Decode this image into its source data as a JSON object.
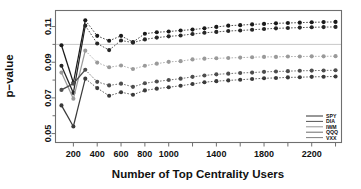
{
  "chart_data": {
    "type": "line",
    "title": "",
    "xlabel": "Number of Top Centrality Users",
    "ylabel": "p−value",
    "xlim": [
      50,
      2450
    ],
    "ylim": [
      0.045,
      0.119
    ],
    "xticks": [
      200,
      400,
      600,
      800,
      1000,
      1400,
      1800,
      2200
    ],
    "xtick_labels": [
      "200",
      "400",
      "600",
      "800",
      "1000",
      "1400",
      "1800",
      "2200"
    ],
    "yticks": [
      0.05,
      0.07,
      0.09,
      0.11
    ],
    "ytick_labels": [
      "0.05",
      "0.07",
      "0.09",
      "0.11"
    ],
    "grid": false,
    "legend_position": "bottom-right",
    "reference_line": {
      "orientation": "horizontal",
      "value": 0.1,
      "color": "#c9c9c9"
    },
    "x": [
      100,
      200,
      300,
      400,
      500,
      600,
      700,
      800,
      900,
      1000,
      1100,
      1200,
      1300,
      1400,
      1500,
      1600,
      1700,
      1800,
      1900,
      2000,
      2100,
      2200,
      2300,
      2400
    ],
    "series": [
      {
        "name": "SPY",
        "color": "#1a1a1a",
        "values": [
          0.0995,
          0.0785,
          0.1135,
          0.1048,
          0.102,
          0.1048,
          0.1013,
          0.106,
          0.1068,
          0.1072,
          0.1078,
          0.1083,
          0.109,
          0.1098,
          0.1105,
          0.1108,
          0.1112,
          0.1115,
          0.1118,
          0.112,
          0.1122,
          0.1124,
          0.1125,
          0.1126
        ]
      },
      {
        "name": "DIA",
        "color": "#262626",
        "values": [
          0.088,
          0.0728,
          0.1105,
          0.1005,
          0.0968,
          0.1022,
          0.101,
          0.1028,
          0.1038,
          0.1045,
          0.105,
          0.1058,
          0.1065,
          0.107,
          0.1075,
          0.1078,
          0.1082,
          0.1086,
          0.109,
          0.1092,
          0.1094,
          0.1096,
          0.1097,
          0.1098
        ]
      },
      {
        "name": "IWM",
        "color": "#9a9a9a",
        "values": [
          0.0842,
          0.0695,
          0.0965,
          0.0898,
          0.0872,
          0.0882,
          0.0862,
          0.088,
          0.0892,
          0.0902,
          0.0906,
          0.0916,
          0.092,
          0.0922,
          0.0924,
          0.0926,
          0.0928,
          0.093,
          0.093,
          0.0932,
          0.0932,
          0.0933,
          0.0933,
          0.0934
        ]
      },
      {
        "name": "QQQ",
        "color": "#4d4d4d",
        "values": [
          0.0745,
          0.078,
          0.0858,
          0.079,
          0.077,
          0.078,
          0.0762,
          0.0782,
          0.0792,
          0.08,
          0.0808,
          0.0818,
          0.0826,
          0.0832,
          0.0836,
          0.084,
          0.0842,
          0.0846,
          0.0848,
          0.085,
          0.0852,
          0.0853,
          0.0854,
          0.0855
        ]
      },
      {
        "name": "VXX",
        "color": "#3a3a3a",
        "values": [
          0.0658,
          0.054,
          0.0808,
          0.0755,
          0.0712,
          0.0732,
          0.0718,
          0.0742,
          0.0752,
          0.076,
          0.0768,
          0.0778,
          0.0788,
          0.0794,
          0.0798,
          0.0802,
          0.0806,
          0.081,
          0.0812,
          0.0815,
          0.0816,
          0.0818,
          0.0819,
          0.082
        ]
      }
    ]
  },
  "legend": {
    "entries": [
      {
        "label": "SPY",
        "color": "#1a1a1a"
      },
      {
        "label": "DIA",
        "color": "#404040"
      },
      {
        "label": "IWM",
        "color": "#8a8a8a"
      },
      {
        "label": "QQQ",
        "color": "#5a5a5a"
      },
      {
        "label": "VXX",
        "color": "#707070"
      }
    ]
  }
}
